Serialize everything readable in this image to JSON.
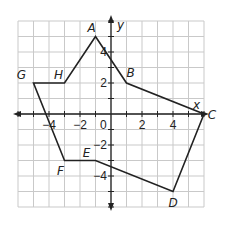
{
  "diagram": {
    "type": "coordinate-plane-polygon",
    "axes": {
      "x_label": "x",
      "y_label": "y",
      "x_range": [
        -6,
        6
      ],
      "y_range": [
        -6,
        6
      ],
      "grid_step": 1,
      "origin_label": "0",
      "x_tick_labels": [
        {
          "value": -4,
          "text": "−4"
        },
        {
          "value": -2,
          "text": "−2"
        },
        {
          "value": 2,
          "text": "2"
        },
        {
          "value": 4,
          "text": "4"
        }
      ],
      "y_tick_labels": [
        {
          "value": 4,
          "text": "4"
        },
        {
          "value": 2,
          "text": "2"
        },
        {
          "value": -2,
          "text": "−2"
        },
        {
          "value": -4,
          "text": "−4"
        }
      ]
    },
    "polygon": {
      "name": "ABCDEFGH",
      "vertices": [
        {
          "label": "A",
          "x": -1,
          "y": 5
        },
        {
          "label": "B",
          "x": 1,
          "y": 2
        },
        {
          "label": "C",
          "x": 6,
          "y": 0
        },
        {
          "label": "D",
          "x": 4,
          "y": -5
        },
        {
          "label": "E",
          "x": -1,
          "y": -3
        },
        {
          "label": "F",
          "x": -3,
          "y": -3
        },
        {
          "label": "G",
          "x": -5,
          "y": 2
        },
        {
          "label": "H",
          "x": -3,
          "y": 2
        }
      ]
    },
    "colors": {
      "grid": "#c9c9c9",
      "lines": "#222222",
      "background": "#ffffff"
    }
  }
}
